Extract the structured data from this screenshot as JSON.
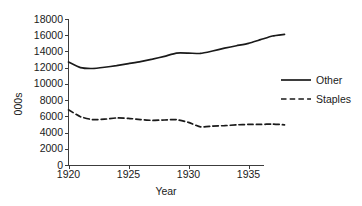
{
  "chart_data": {
    "type": "line",
    "title": "",
    "xlabel": "Year",
    "ylabel": "000s",
    "xlim": [
      1920,
      1938
    ],
    "ylim": [
      0,
      18000
    ],
    "grid": false,
    "legend_position": "right",
    "x_ticks": [
      "1920",
      "1925",
      "1930",
      "1935"
    ],
    "x_tick_values": [
      1920,
      1925,
      1930,
      1935
    ],
    "y_ticks": [
      "0",
      "2000",
      "4000",
      "6000",
      "8000",
      "10000",
      "12000",
      "14000",
      "16000",
      "18000"
    ],
    "y_tick_values": [
      0,
      2000,
      4000,
      6000,
      8000,
      10000,
      12000,
      14000,
      16000,
      18000
    ],
    "x": [
      1920,
      1921,
      1922,
      1923,
      1924,
      1925,
      1926,
      1927,
      1928,
      1929,
      1930,
      1931,
      1932,
      1933,
      1934,
      1935,
      1936,
      1937,
      1938
    ],
    "series": [
      {
        "name": "Other",
        "style": "solid",
        "color": "#1a1a1a",
        "values": [
          12700,
          12000,
          11900,
          12050,
          12250,
          12500,
          12750,
          13050,
          13400,
          13800,
          13800,
          13750,
          14050,
          14400,
          14700,
          15000,
          15450,
          15900,
          16100
        ]
      },
      {
        "name": "Staples",
        "style": "dashed",
        "color": "#1a1a1a",
        "values": [
          6800,
          5950,
          5600,
          5650,
          5800,
          5750,
          5600,
          5500,
          5550,
          5600,
          5250,
          4700,
          4800,
          4850,
          4950,
          5000,
          5000,
          5050,
          4950
        ]
      }
    ],
    "legend": [
      {
        "label": "Other",
        "style": "solid"
      },
      {
        "label": "Staples",
        "style": "dashed"
      }
    ]
  }
}
